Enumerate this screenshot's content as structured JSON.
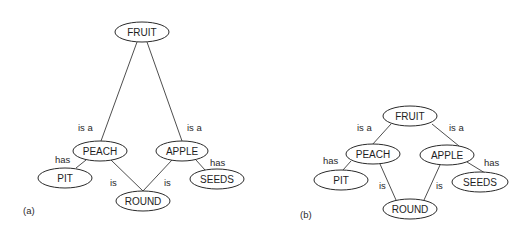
{
  "panels": [
    {
      "id": "a",
      "label": "(a)",
      "nodes": {
        "fruit": {
          "text": "FRUIT"
        },
        "peach": {
          "text": "PEACH"
        },
        "apple": {
          "text": "APPLE"
        },
        "pit": {
          "text": "PIT"
        },
        "seeds": {
          "text": "SEEDS"
        },
        "round": {
          "text": "ROUND"
        }
      },
      "edges": {
        "peach_isa_fruit": {
          "label": "is a"
        },
        "apple_isa_fruit": {
          "label": "is a"
        },
        "peach_has_pit": {
          "label": "has"
        },
        "apple_has_seeds": {
          "label": "has"
        },
        "peach_is_round": {
          "label": "is"
        },
        "apple_is_round": {
          "label": "is"
        }
      }
    },
    {
      "id": "b",
      "label": "(b)",
      "nodes": {
        "fruit": {
          "text": "FRUIT"
        },
        "peach": {
          "text": "PEACH"
        },
        "apple": {
          "text": "APPLE"
        },
        "pit": {
          "text": "PIT"
        },
        "seeds": {
          "text": "SEEDS"
        },
        "round": {
          "text": "ROUND"
        }
      },
      "edges": {
        "peach_isa_fruit": {
          "label": "is a"
        },
        "apple_isa_fruit": {
          "label": "is a"
        },
        "peach_has_pit": {
          "label": "has"
        },
        "apple_has_seeds": {
          "label": "has"
        },
        "peach_is_round": {
          "label": "is"
        },
        "apple_is_round": {
          "label": "is"
        }
      }
    }
  ]
}
